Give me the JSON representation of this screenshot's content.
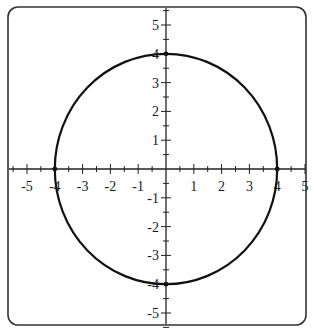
{
  "chart_data": {
    "type": "line",
    "title": "",
    "xlabel": "",
    "ylabel": "",
    "xlim": [
      -5.5,
      5.5
    ],
    "ylim": [
      -5.5,
      5.5
    ],
    "grid": false,
    "legend": null,
    "x_ticks": [
      -5,
      -4,
      -3,
      -2,
      -1,
      1,
      2,
      3,
      4,
      5
    ],
    "y_ticks": [
      5,
      4,
      3,
      2,
      1,
      -1,
      -2,
      -3,
      -4,
      -5
    ],
    "minor_tick_step": 0.5,
    "series": [
      {
        "name": "circle",
        "equation": "x^2 + y^2 = 16",
        "center": [
          0,
          0
        ],
        "radius": 4,
        "key_points": [
          [
            4,
            0
          ],
          [
            0,
            4
          ],
          [
            -4,
            0
          ],
          [
            0,
            -4
          ]
        ]
      }
    ],
    "colors": {
      "curve": "#111111",
      "axes": "#222222",
      "frame": "#333333"
    }
  }
}
